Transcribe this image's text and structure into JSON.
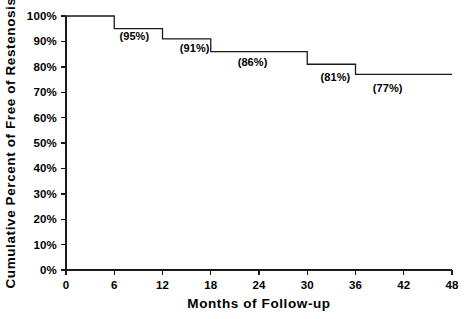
{
  "chart_data": {
    "type": "line",
    "title": "",
    "subtitle": "",
    "xlabel": "Months of Follow-up",
    "ylabel": "Cumulative Percent of Free of Restenosis",
    "xlim": [
      0,
      48
    ],
    "ylim": [
      0,
      100
    ],
    "grid": false,
    "legend": "none",
    "step_style": "post",
    "x": [
      0,
      6,
      12,
      18,
      30,
      36,
      48
    ],
    "values": [
      100,
      95,
      91,
      86,
      81,
      77,
      77
    ],
    "series": [
      {
        "name": "Freedom from restenosis",
        "values": [
          100,
          95,
          91,
          86,
          81,
          77,
          77
        ]
      }
    ],
    "xticks": [
      0,
      6,
      12,
      18,
      24,
      30,
      36,
      42,
      48
    ],
    "xtick_labels": [
      "0",
      "6",
      "12",
      "18",
      "24",
      "30",
      "36",
      "42",
      "48"
    ],
    "yticks": [
      0,
      10,
      20,
      30,
      40,
      50,
      60,
      70,
      80,
      90,
      100
    ],
    "ytick_labels": [
      "0%",
      "10%",
      "20%",
      "30%",
      "40%",
      "50%",
      "60%",
      "70%",
      "80%",
      "90%",
      "100%"
    ],
    "annotations": [
      {
        "text": "(95%)",
        "x": 8.5,
        "y": 90.5
      },
      {
        "text": "(91%)",
        "x": 16.0,
        "y": 86.0
      },
      {
        "text": "(86%)",
        "x": 23.2,
        "y": 80.5
      },
      {
        "text": "(81%)",
        "x": 33.5,
        "y": 74.5
      },
      {
        "text": "(77%)",
        "x": 40.0,
        "y": 70.0
      }
    ],
    "line_color": "#1a1a1a",
    "background_color": "#ffffff"
  }
}
